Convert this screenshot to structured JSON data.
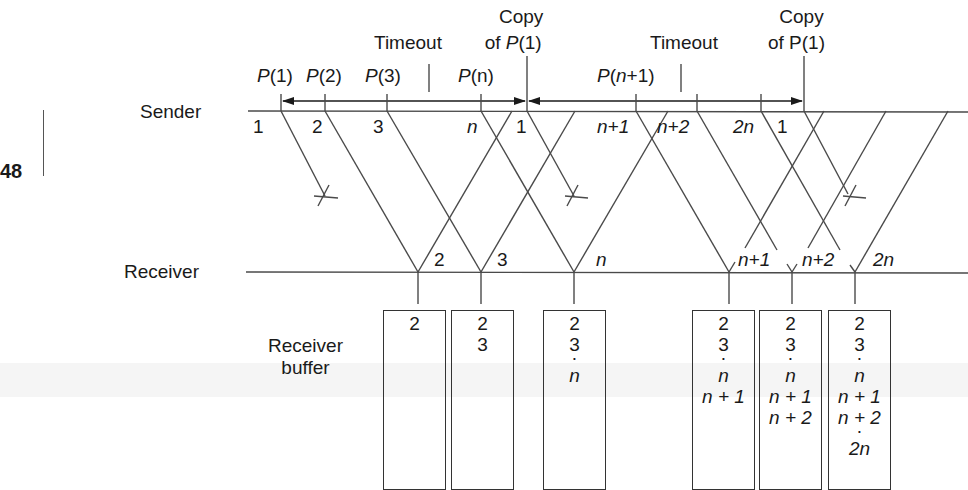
{
  "page_number": "48",
  "labels": {
    "sender": "Sender",
    "receiver": "Receiver",
    "receiver_buffer_line1": "Receiver",
    "receiver_buffer_line2": "buffer"
  },
  "top_annotations": {
    "timeout_1": "Timeout",
    "copy_1_line1": "Copy",
    "copy_1_line2_prefix": "of ",
    "copy_1_line2_p": "P",
    "copy_1_line2_suffix": "(1)",
    "timeout_2": "Timeout",
    "copy_2_line1": "Copy",
    "copy_2_line2": "of P(1)"
  },
  "sender_packets": [
    {
      "p": "P",
      "idx": "(1)"
    },
    {
      "p": "P",
      "idx": "(2)"
    },
    {
      "p": "P",
      "idx": "(3)"
    },
    {
      "p": "P",
      "idx": "(n)"
    },
    {
      "p": "P",
      "idx_open": "(",
      "idx_var": "n",
      "idx_close": "+1)"
    }
  ],
  "sender_seq_labels": [
    "1",
    "2",
    "3",
    "n",
    "1",
    "n+1",
    "n+2",
    "2n",
    "1"
  ],
  "receiver_seq_labels": [
    "2",
    "3",
    "n",
    "n+1",
    "n+2",
    "2n"
  ],
  "buffers": [
    {
      "items": [
        "2"
      ]
    },
    {
      "items": [
        "2",
        "3"
      ]
    },
    {
      "items": [
        "2",
        "3",
        "·",
        "n"
      ]
    },
    {
      "items": [
        "2",
        "3",
        "·",
        "n",
        "n + 1"
      ]
    },
    {
      "items": [
        "2",
        "3",
        "·",
        "n",
        "n + 1",
        "n + 2"
      ]
    },
    {
      "items": [
        "2",
        "3",
        "·",
        "n",
        "n + 1",
        "n + 2",
        "·",
        "2n"
      ]
    }
  ],
  "colors": {
    "line": "#4a4a4a",
    "text": "#1a1a1a",
    "band": "#ececec"
  }
}
